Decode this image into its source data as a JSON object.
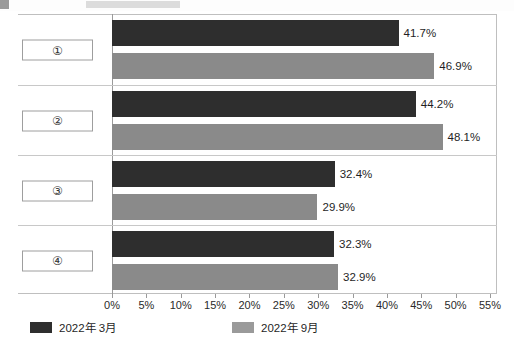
{
  "chart_data": {
    "type": "bar",
    "orientation": "horizontal",
    "title": "",
    "xlabel": "",
    "ylabel": "",
    "categories": [
      "①",
      "②",
      "③",
      "④"
    ],
    "series": [
      {
        "name": "2022年 3月",
        "color": "#2e2e2e",
        "values": [
          41.7,
          44.2,
          32.4,
          32.3
        ]
      },
      {
        "name": "2022年 9月",
        "color": "#8a8a8a",
        "values": [
          46.9,
          48.1,
          29.9,
          32.9
        ]
      }
    ],
    "value_labels": [
      [
        "41.7%",
        "44.2%",
        "32.4%",
        "32.3%"
      ],
      [
        "46.9%",
        "48.1%",
        "29.9%",
        "32.9%"
      ]
    ],
    "xlim": [
      0,
      55
    ],
    "xtick_step": 5,
    "xticks": [
      0,
      5,
      10,
      15,
      20,
      25,
      30,
      35,
      40,
      45,
      50,
      55
    ],
    "xtick_labels": [
      "0%",
      "5%",
      "10%",
      "15%",
      "20%",
      "25%",
      "30%",
      "35%",
      "40%",
      "45%",
      "50%",
      "55%"
    ],
    "grid": false,
    "legend_position": "bottom-left"
  },
  "legend": {
    "items": [
      {
        "label": "2022年 3月",
        "swatch": "dark"
      },
      {
        "label": "2022年 9月",
        "swatch": "light"
      }
    ]
  }
}
